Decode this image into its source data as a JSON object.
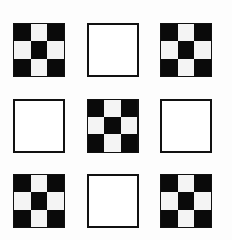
{
  "figure": {
    "colors": {
      "black": "#0a0a0a",
      "white": "#f4f4f4",
      "background": "#fdfdfd"
    },
    "checker_pattern": [
      "b",
      "w",
      "b",
      "w",
      "b",
      "w",
      "b",
      "w",
      "b"
    ],
    "tiles": [
      {
        "row": 0,
        "col": 0,
        "type": "checker"
      },
      {
        "row": 0,
        "col": 1,
        "type": "plain"
      },
      {
        "row": 0,
        "col": 2,
        "type": "checker"
      },
      {
        "row": 1,
        "col": 0,
        "type": "plain"
      },
      {
        "row": 1,
        "col": 1,
        "type": "checker"
      },
      {
        "row": 1,
        "col": 2,
        "type": "plain"
      },
      {
        "row": 2,
        "col": 0,
        "type": "checker"
      },
      {
        "row": 2,
        "col": 1,
        "type": "plain"
      },
      {
        "row": 2,
        "col": 2,
        "type": "checker"
      }
    ]
  }
}
